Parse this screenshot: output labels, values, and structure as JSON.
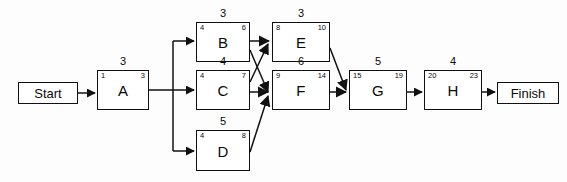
{
  "diagram": {
    "type": "activity-on-node-network",
    "stroke_color": "#111111",
    "background_color": "#ffffff"
  },
  "terminals": {
    "start": {
      "label": "Start",
      "x": 18,
      "y": 82,
      "w": 60,
      "h": 22
    },
    "finish": {
      "label": "Finish",
      "x": 497,
      "y": 82,
      "w": 62,
      "h": 22
    }
  },
  "nodes": [
    {
      "id": "A",
      "label": "A",
      "duration": "3",
      "early_start": "1",
      "early_finish": "3",
      "x": 97,
      "y": 70,
      "w": 52,
      "h": 40
    },
    {
      "id": "B",
      "label": "B",
      "duration": "3",
      "early_start": "4",
      "early_finish": "6",
      "x": 196,
      "y": 22,
      "w": 54,
      "h": 40
    },
    {
      "id": "C",
      "label": "C",
      "duration": "4",
      "early_start": "4",
      "early_finish": "7",
      "x": 196,
      "y": 70,
      "w": 54,
      "h": 40
    },
    {
      "id": "D",
      "label": "D",
      "duration": "5",
      "early_start": "4",
      "early_finish": "8",
      "x": 196,
      "y": 130,
      "w": 54,
      "h": 41
    },
    {
      "id": "E",
      "label": "E",
      "duration": "3",
      "early_start": "8",
      "early_finish": "10",
      "x": 272,
      "y": 22,
      "w": 58,
      "h": 40
    },
    {
      "id": "F",
      "label": "F",
      "duration": "6",
      "early_start": "9",
      "early_finish": "14",
      "x": 272,
      "y": 70,
      "w": 58,
      "h": 40
    },
    {
      "id": "G",
      "label": "G",
      "duration": "5",
      "early_start": "15",
      "early_finish": "19",
      "x": 349,
      "y": 70,
      "w": 58,
      "h": 40
    },
    {
      "id": "H",
      "label": "H",
      "duration": "4",
      "early_start": "20",
      "early_finish": "23",
      "x": 424,
      "y": 70,
      "w": 58,
      "h": 40
    }
  ],
  "edges": [
    {
      "from": "Start",
      "to": "A"
    },
    {
      "from": "A",
      "to": "B"
    },
    {
      "from": "A",
      "to": "C"
    },
    {
      "from": "A",
      "to": "D"
    },
    {
      "from": "B",
      "to": "E"
    },
    {
      "from": "B",
      "to": "F"
    },
    {
      "from": "C",
      "to": "E"
    },
    {
      "from": "C",
      "to": "F"
    },
    {
      "from": "D",
      "to": "F"
    },
    {
      "from": "E",
      "to": "G"
    },
    {
      "from": "F",
      "to": "G"
    },
    {
      "from": "G",
      "to": "H"
    },
    {
      "from": "H",
      "to": "Finish"
    }
  ]
}
